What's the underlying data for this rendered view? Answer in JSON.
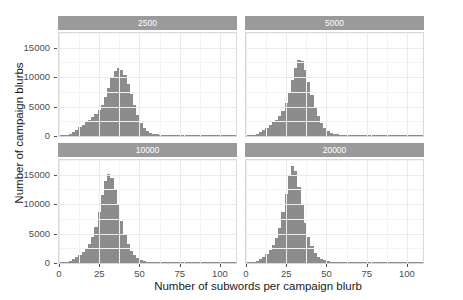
{
  "chart_data": {
    "type": "bar",
    "title": "",
    "subtitle": "",
    "xlabel": "Number of subwords per campaign blurb",
    "ylabel": "Number of campaign blurbs",
    "xlim": [
      0,
      110
    ],
    "ylim": [
      0,
      17500
    ],
    "grid": true,
    "legend": "none",
    "facet_variable": "vocab_size",
    "facet_layout": "2x2",
    "x_ticks": [
      0,
      25,
      50,
      75,
      100
    ],
    "y_ticks": [
      0,
      5000,
      10000,
      15000
    ],
    "bin_width": 2,
    "bar_color": "#8c8c8c",
    "strip_color": "#9a9a9a",
    "strip_text_color": "#ffffff",
    "panel_background": "#ffffff",
    "grid_color": "#ebebeb",
    "facets": [
      {
        "label": "2500",
        "position": "top-left",
        "bin_centers": [
          1,
          3,
          5,
          7,
          9,
          11,
          13,
          15,
          17,
          19,
          21,
          23,
          25,
          27,
          29,
          31,
          33,
          35,
          37,
          39,
          41,
          43,
          45,
          47,
          49,
          51,
          53,
          55,
          57,
          59,
          61,
          63,
          65,
          67,
          69,
          71,
          73,
          75,
          77,
          79,
          81,
          83,
          85,
          87,
          89,
          91,
          93,
          95,
          97,
          99,
          101,
          103,
          105,
          107,
          109
        ],
        "values": [
          60,
          120,
          240,
          420,
          700,
          1050,
          1450,
          1900,
          2350,
          2800,
          3250,
          3750,
          4400,
          5300,
          6600,
          8200,
          9900,
          11100,
          11500,
          11200,
          10300,
          8900,
          7100,
          5200,
          3500,
          2200,
          1350,
          850,
          560,
          380,
          270,
          200,
          150,
          115,
          90,
          70,
          55,
          45,
          35,
          28,
          22,
          18,
          14,
          11,
          9,
          7,
          6,
          5,
          4,
          3,
          3,
          2,
          2,
          1,
          1
        ]
      },
      {
        "label": "5000",
        "position": "top-right",
        "bin_centers": [
          1,
          3,
          5,
          7,
          9,
          11,
          13,
          15,
          17,
          19,
          21,
          23,
          25,
          27,
          29,
          31,
          33,
          35,
          37,
          39,
          41,
          43,
          45,
          47,
          49,
          51,
          53,
          55,
          57,
          59,
          61,
          63,
          65,
          67,
          69,
          71,
          73,
          75,
          77,
          79,
          81,
          83,
          85,
          87,
          89,
          91,
          93,
          95,
          97,
          99,
          101,
          103,
          105,
          107,
          109
        ],
        "values": [
          50,
          110,
          230,
          400,
          680,
          1000,
          1400,
          1850,
          2300,
          2800,
          3400,
          4300,
          5600,
          7400,
          9600,
          11600,
          13000,
          12700,
          11300,
          9200,
          7000,
          5000,
          3400,
          2200,
          1400,
          880,
          570,
          380,
          260,
          185,
          135,
          100,
          78,
          60,
          47,
          37,
          29,
          23,
          18,
          14,
          11,
          9,
          7,
          6,
          5,
          4,
          3,
          3,
          2,
          2,
          1,
          1,
          1,
          1,
          1
        ]
      },
      {
        "label": "10000",
        "position": "bottom-left",
        "bin_centers": [
          1,
          3,
          5,
          7,
          9,
          11,
          13,
          15,
          17,
          19,
          21,
          23,
          25,
          27,
          29,
          31,
          33,
          35,
          37,
          39,
          41,
          43,
          45,
          47,
          49,
          51,
          53,
          55,
          57,
          59,
          61,
          63,
          65,
          67,
          69,
          71,
          73,
          75,
          77,
          79,
          81,
          83,
          85,
          87,
          89,
          91,
          93,
          95,
          97,
          99,
          101,
          103,
          105,
          107,
          109
        ],
        "values": [
          45,
          100,
          210,
          380,
          640,
          980,
          1400,
          1900,
          2500,
          3300,
          4500,
          6200,
          8600,
          11500,
          14000,
          15200,
          14400,
          12400,
          9800,
          7200,
          5000,
          3300,
          2100,
          1320,
          820,
          520,
          340,
          230,
          160,
          115,
          85,
          64,
          49,
          38,
          30,
          23,
          18,
          14,
          11,
          9,
          7,
          6,
          5,
          4,
          3,
          3,
          2,
          2,
          1,
          1,
          1,
          1,
          1,
          1,
          1
        ]
      },
      {
        "label": "20000",
        "position": "bottom-right",
        "bin_centers": [
          1,
          3,
          5,
          7,
          9,
          11,
          13,
          15,
          17,
          19,
          21,
          23,
          25,
          27,
          29,
          31,
          33,
          35,
          37,
          39,
          41,
          43,
          45,
          47,
          49,
          51,
          53,
          55,
          57,
          59,
          61,
          63,
          65,
          67,
          69,
          71,
          73,
          75,
          77,
          79,
          81,
          83,
          85,
          87,
          89,
          91,
          93,
          95,
          97,
          99,
          101,
          103,
          105,
          107,
          109
        ],
        "values": [
          40,
          95,
          200,
          370,
          640,
          1000,
          1500,
          2150,
          3000,
          4200,
          6000,
          8600,
          11800,
          14800,
          16500,
          15600,
          13000,
          9800,
          6800,
          4500,
          2850,
          1750,
          1080,
          670,
          430,
          285,
          195,
          138,
          100,
          75,
          57,
          44,
          34,
          27,
          21,
          17,
          13,
          11,
          9,
          7,
          6,
          5,
          4,
          3,
          3,
          2,
          2,
          1,
          1,
          1,
          1,
          1,
          1,
          1,
          1
        ]
      }
    ]
  },
  "axes": {
    "x_tick_labels": [
      "0",
      "25",
      "50",
      "75",
      "100"
    ],
    "y_tick_labels": [
      "0",
      "5000",
      "10000",
      "15000"
    ],
    "x_title": "Number of subwords per campaign blurb",
    "y_title": "Number of campaign blurbs"
  }
}
